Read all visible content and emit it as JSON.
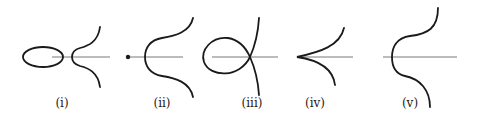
{
  "figure": {
    "panels": [
      {
        "id": "i",
        "label": "(i)",
        "description": "oval plus separate branch"
      },
      {
        "id": "ii",
        "label": "(ii)",
        "description": "isolated point (acnode) plus branch"
      },
      {
        "id": "iii",
        "label": "(iii)",
        "description": "node with loop"
      },
      {
        "id": "iv",
        "label": "(iv)",
        "description": "cusp"
      },
      {
        "id": "v",
        "label": "(v)",
        "description": "single smooth branch"
      }
    ],
    "colors": {
      "curve": "#1a1a1a",
      "axis": "#555555",
      "background": "#ffffff"
    }
  }
}
